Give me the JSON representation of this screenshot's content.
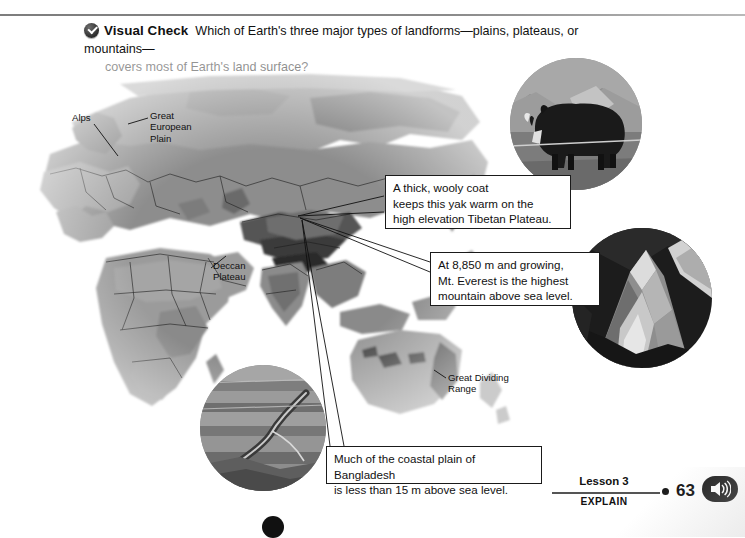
{
  "header": {
    "badge_icon": "check-badge-icon",
    "label": "Visual Check",
    "question_line1": "Which of Earth's three major types of landforms—plains, plateaus, or mountains—",
    "question_line2": "covers most of Earth's land surface?"
  },
  "map": {
    "name": "world-relief-map",
    "labels": [
      {
        "id": "alps",
        "text": "Alps"
      },
      {
        "id": "great-european-plain",
        "text": "Great\nEuropean\nPlain"
      },
      {
        "id": "deccan-plateau",
        "text": "Deccan\nPlateau"
      },
      {
        "id": "great-dividing-range",
        "text": "Great Dividing\nRange"
      }
    ]
  },
  "photos": [
    {
      "id": "yak-photo",
      "alt": "Yak on the Tibetan Plateau"
    },
    {
      "id": "everest-photo",
      "alt": "Mount Everest"
    },
    {
      "id": "bangladesh-photo",
      "alt": "Coastal plain of Bangladesh"
    }
  ],
  "callouts": [
    {
      "id": "callout-yak",
      "line1": "A thick, wooly coat",
      "line2": "keeps this yak warm on the",
      "line3": "high elevation Tibetan Plateau."
    },
    {
      "id": "callout-everest",
      "line1": "At 8,850 m and growing,",
      "line2": "Mt. Everest is the highest",
      "line3": "mountain above sea level."
    },
    {
      "id": "callout-bangladesh",
      "line1": "Much of the coastal plain of Bangladesh",
      "line2": "is less than 15 m above sea level."
    }
  ],
  "footer": {
    "lesson": "Lesson 3",
    "stage": "EXPLAIN",
    "page_number": "63",
    "audio_icon": "speaker-audio-icon"
  }
}
